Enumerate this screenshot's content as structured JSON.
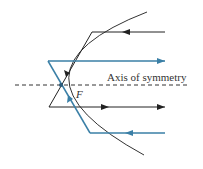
{
  "diagram": {
    "axis_label": "Axis of symmetry",
    "focus_label": "F",
    "colors": {
      "black_ray": "#222222",
      "blue_ray": "#3a7fa6",
      "parabola": "#333333",
      "axis": "#333333"
    },
    "elements": {
      "parabola": "curve opening right, vertex at left",
      "axis": "dashed horizontal line through vertex and focus",
      "rays": [
        {
          "color": "black",
          "incoming": "top, right-to-left",
          "reflected": "through focus to lower-left, exits right"
        },
        {
          "color": "blue",
          "incoming": "bottom, right-to-left",
          "reflected": "through focus to upper-left, exits right"
        }
      ]
    }
  }
}
